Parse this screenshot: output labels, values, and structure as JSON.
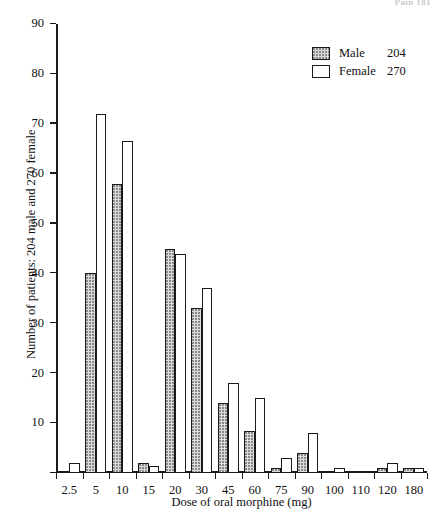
{
  "page_header": "Pain 181",
  "chart_data": {
    "type": "bar",
    "title": "",
    "xlabel": "Dose of oral morphine (mg)",
    "ylabel": "Number of patients: 204 male and 270 female",
    "categories": [
      "2.5",
      "5",
      "10",
      "15",
      "20",
      "30",
      "45",
      "60",
      "75",
      "90",
      "100",
      "110",
      "120",
      "180"
    ],
    "series": [
      {
        "name": "Male",
        "total": 204,
        "values": [
          0,
          40,
          58,
          2,
          45,
          33,
          14,
          8.5,
          1,
          4,
          0,
          0,
          1,
          1
        ]
      },
      {
        "name": "Female",
        "total": 270,
        "values": [
          2,
          72,
          66.5,
          1.5,
          44,
          37,
          18,
          15,
          3,
          8,
          1,
          0,
          2,
          1
        ]
      }
    ],
    "ylim": [
      0,
      90
    ],
    "yticks": [
      0,
      10,
      20,
      30,
      40,
      50,
      60,
      70,
      80,
      90
    ],
    "ytick_labels": [
      "",
      "10",
      "20",
      "30",
      "40",
      "50",
      "60",
      "70",
      "80",
      "90"
    ],
    "grid": false,
    "legend_position": "top-right"
  },
  "legend": {
    "items": [
      {
        "label": "Male",
        "count": "204",
        "swatch": "male"
      },
      {
        "label": "Female",
        "count": "270",
        "swatch": "female"
      }
    ]
  }
}
